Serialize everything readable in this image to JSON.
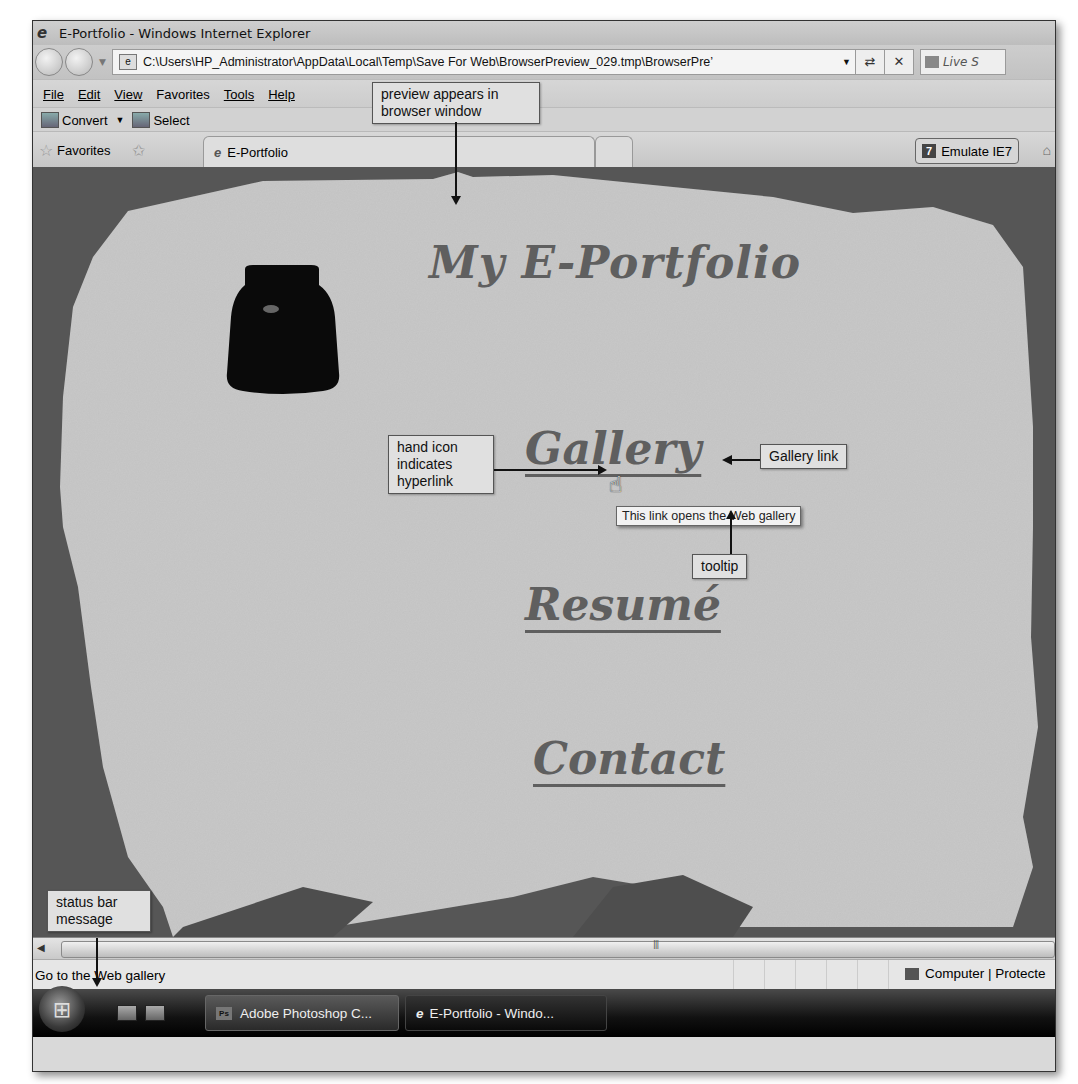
{
  "window": {
    "title": "E-Portfolio - Windows Internet Explorer"
  },
  "navigation": {
    "address_url": "C:\\Users\\HP_Administrator\\AppData\\Local\\Temp\\Save For Web\\BrowserPreview_029.tmp\\BrowserPre’",
    "refresh_glyph": "⇄",
    "stop_glyph": "✕",
    "search_placeholder": "Live S"
  },
  "menu": {
    "items": [
      {
        "label": "File",
        "accel": "F"
      },
      {
        "label": "Edit",
        "accel": "E"
      },
      {
        "label": "View",
        "accel": "V"
      },
      {
        "label": "Favorites",
        "accel": "a"
      },
      {
        "label": "Tools",
        "accel": "T"
      },
      {
        "label": "Help",
        "accel": "H"
      }
    ],
    "file": "File",
    "edit": "Edit",
    "view": "View",
    "favorites": "Favorites",
    "tools": "Tools",
    "help": "Help"
  },
  "command_bar": {
    "convert_label": "Convert",
    "select_label": "Select"
  },
  "favorites_bar": {
    "favorites_label": "Favorites",
    "tab_label": "E-Portfolio",
    "emulate_label": "Emulate IE7",
    "emulate_badge": "7"
  },
  "page": {
    "title": "My E-Portfolio",
    "links": [
      {
        "label": "Gallery",
        "tooltip": "This link opens the Web gallery",
        "status": "Go to the Web gallery"
      },
      {
        "label": "Resumé"
      },
      {
        "label": "Contact"
      }
    ]
  },
  "tooltip": {
    "text": "This link opens the Web gallery"
  },
  "status_bar": {
    "message": "Go to the Web gallery",
    "zone": "Computer | Protecte"
  },
  "taskbar": {
    "items": [
      {
        "label": "Adobe Photoshop C...",
        "icon": "Ps"
      },
      {
        "label": "E-Portfolio - Windo..."
      }
    ]
  },
  "callouts": {
    "preview": "preview appears in browser window",
    "hand_icon": "hand icon indicates hyperlink",
    "gallery_link": "Gallery link",
    "tooltip": "tooltip",
    "status_bar": "status bar message"
  },
  "colors": {
    "page_background": "#565656",
    "paper": "#c9c9c9",
    "heading_text": "#5f5f5f"
  }
}
